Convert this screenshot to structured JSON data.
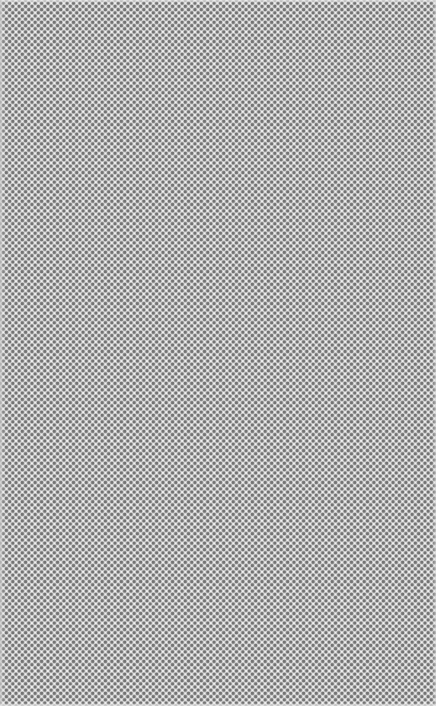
{
  "texture": {
    "description": "Halftone dot pattern",
    "pattern": "staggered-dot-grid",
    "dot_color": "#737373",
    "background_color": "#f2f2f2"
  }
}
